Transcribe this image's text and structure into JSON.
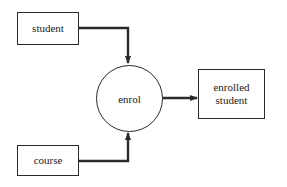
{
  "diagram": {
    "type": "data-flow",
    "nodes": [
      {
        "id": "student",
        "shape": "rectangle",
        "label": "student"
      },
      {
        "id": "course",
        "shape": "rectangle",
        "label": "course"
      },
      {
        "id": "enrol",
        "shape": "circle",
        "label": "enrol"
      },
      {
        "id": "enrolled_student",
        "shape": "rectangle",
        "label": "enrolled\nstudent"
      }
    ],
    "edges": [
      {
        "from": "student",
        "to": "enrol"
      },
      {
        "from": "course",
        "to": "enrol"
      },
      {
        "from": "enrol",
        "to": "enrolled_student"
      }
    ],
    "colors": {
      "line": "#2a2a2a",
      "background": "#ffffff"
    }
  }
}
